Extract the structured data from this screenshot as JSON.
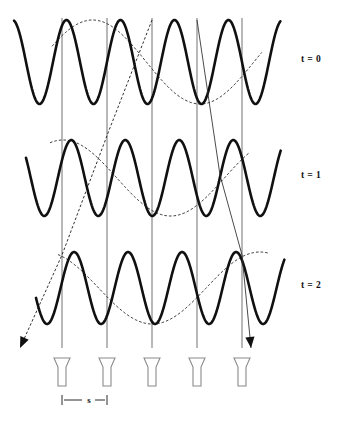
{
  "figure": {
    "title": "",
    "background_color": "#ffffff",
    "width": 347,
    "height": 423
  },
  "row_labels": [
    {
      "text": "t = 0",
      "x": 311,
      "y": 62
    },
    {
      "text": "t = 1",
      "x": 311,
      "y": 178
    },
    {
      "text": "t = 2",
      "x": 311,
      "y": 288
    }
  ],
  "scale_marker": {
    "label": "s",
    "label_x": 89,
    "label_y": 403,
    "left_x": 62,
    "right_x": 107,
    "y": 400,
    "tick_half_height": 5
  },
  "grid": {
    "color": "#8d8d8d",
    "x_positions": [
      62,
      107,
      152,
      197,
      242
    ],
    "y_top": 18,
    "y_bottom": 348
  },
  "transducers": {
    "count": 5,
    "x_positions": [
      62,
      107,
      152,
      197,
      242
    ],
    "top_y": 358,
    "bottom_y": 386,
    "mouth_half_width": 8,
    "stem_half_width": 4,
    "flare_y": 367,
    "stroke_color": "#8a8a8a",
    "fill_color": "#ffffff"
  },
  "chart_data": {
    "type": "line",
    "xlabel": "",
    "ylabel": "",
    "xlim": [
      12,
      282
    ],
    "grid": true,
    "legend": "none",
    "rows": [
      {
        "name": "t = 0",
        "label": "t = 0",
        "baseline_y": 62,
        "carrier": {
          "name": "carrier wave",
          "style": "thick-solid",
          "amplitude": 42,
          "wavelength": 54,
          "phase_deg": 100,
          "x_start": 14,
          "x_end": 281
        },
        "envelope": {
          "name": "envelope wave",
          "style": "thin-dashed",
          "amplitude": 42,
          "wavelength": 215,
          "phase_deg": 22,
          "x_start": 52,
          "x_end": 262
        }
      },
      {
        "name": "t = 1",
        "label": "t = 1",
        "baseline_y": 178,
        "carrier": {
          "name": "carrier wave",
          "style": "thick-solid",
          "amplitude": 38,
          "wavelength": 54,
          "phase_deg": 148,
          "x_start": 26,
          "x_end": 281
        },
        "envelope": {
          "name": "envelope wave",
          "style": "thin-dashed",
          "amplitude": 38,
          "wavelength": 215,
          "phase_deg": 68,
          "x_start": 50,
          "x_end": 250
        }
      },
      {
        "name": "t = 2",
        "label": "t = 2",
        "baseline_y": 288,
        "carrier": {
          "name": "carrier wave",
          "style": "thick-solid",
          "amplitude": 36,
          "wavelength": 54,
          "phase_deg": 196,
          "x_start": 36,
          "x_end": 285
        },
        "envelope": {
          "name": "envelope wave",
          "style": "thin-dashed",
          "amplitude": 36,
          "wavelength": 215,
          "phase_deg": 112,
          "x_start": 58,
          "x_end": 268
        }
      }
    ],
    "rays": [
      {
        "name": "dashed-ray-left",
        "style": "thin-dashed",
        "points": [
          [
            152,
            20
          ],
          [
            108,
            133
          ],
          [
            62,
            255
          ],
          [
            20,
            348
          ]
        ],
        "arrow_at": "end",
        "arrow_angle_deg": 115
      },
      {
        "name": "solid-ray-right",
        "style": "thin-solid",
        "points": [
          [
            197,
            20
          ],
          [
            220,
            175
          ],
          [
            242,
            255
          ],
          [
            251,
            348
          ]
        ],
        "arrow_at": "end",
        "arrow_angle_deg": 72
      }
    ]
  }
}
